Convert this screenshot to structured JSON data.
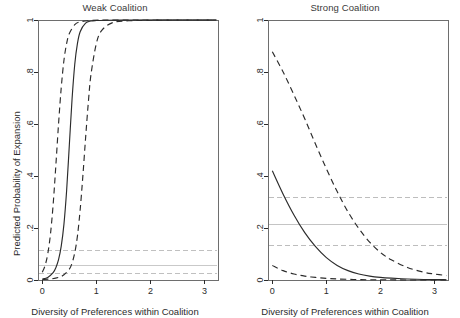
{
  "figure": {
    "width": 460,
    "height": 318,
    "background": "#ffffff",
    "ink": "#2b2b2b",
    "faint": "#b8b8b8"
  },
  "chart_data": [
    {
      "type": "line",
      "title": "Weak Coalition",
      "xlabel": "Diversity of Preferences within Coalition",
      "ylabel": "Predicted Probability of Expansion",
      "xlim": [
        -0.08,
        3.25
      ],
      "ylim": [
        0,
        1
      ],
      "xticks": [
        0,
        1,
        2,
        3
      ],
      "xticklabels": [
        "0",
        "1",
        "2",
        "3"
      ],
      "yticks": [
        0,
        0.2,
        0.4,
        0.6,
        0.8,
        1
      ],
      "yticklabels": [
        "0",
        ".2",
        ".4",
        ".6",
        ".8",
        "1"
      ],
      "grid": false,
      "legend": "none",
      "series": [
        {
          "name": "Predicted probability",
          "style": "solid",
          "color": "#2b2b2b",
          "x": [
            0.0,
            0.1,
            0.2,
            0.25,
            0.3,
            0.35,
            0.4,
            0.45,
            0.5,
            0.55,
            0.6,
            0.65,
            0.7,
            0.8,
            0.9,
            1.0,
            1.2,
            1.6,
            2.0,
            2.5,
            3.0,
            3.22
          ],
          "y": [
            0.004,
            0.01,
            0.028,
            0.047,
            0.078,
            0.13,
            0.215,
            0.345,
            0.52,
            0.695,
            0.83,
            0.91,
            0.955,
            0.988,
            0.996,
            0.998,
            0.999,
            1.0,
            1.0,
            1.0,
            1.0,
            1.0
          ]
        },
        {
          "name": "Upper 95% confidence bound",
          "style": "dashed",
          "color": "#2b2b2b",
          "x": [
            0.0,
            0.05,
            0.1,
            0.15,
            0.2,
            0.25,
            0.3,
            0.35,
            0.4,
            0.45,
            0.5,
            0.6,
            0.7,
            0.9,
            1.2,
            1.6,
            2.0,
            2.5,
            3.0,
            3.22
          ],
          "y": [
            0.03,
            0.055,
            0.1,
            0.175,
            0.29,
            0.44,
            0.6,
            0.74,
            0.845,
            0.91,
            0.948,
            0.982,
            0.993,
            0.998,
            1.0,
            1.0,
            1.0,
            1.0,
            1.0,
            1.0
          ]
        },
        {
          "name": "Lower 95% confidence bound",
          "style": "dashed",
          "color": "#2b2b2b",
          "x": [
            0.0,
            0.15,
            0.3,
            0.4,
            0.5,
            0.55,
            0.6,
            0.65,
            0.7,
            0.75,
            0.8,
            0.85,
            0.9,
            1.0,
            1.1,
            1.3,
            1.6,
            2.0,
            2.5,
            3.0,
            3.22
          ],
          "y": [
            0.002,
            0.004,
            0.01,
            0.02,
            0.042,
            0.065,
            0.105,
            0.17,
            0.27,
            0.4,
            0.545,
            0.68,
            0.79,
            0.91,
            0.96,
            0.99,
            0.997,
            0.999,
            1.0,
            1.0,
            1.0
          ]
        }
      ],
      "reference_lines": [
        {
          "name": "upper-reference",
          "style": "dashed",
          "y": 0.112,
          "color": "#c0c0c0"
        },
        {
          "name": "mean-reference",
          "style": "solid",
          "y": 0.055,
          "color": "#c9c9c9"
        },
        {
          "name": "lower-reference",
          "style": "dashed",
          "y": 0.025,
          "color": "#c0c0c0"
        }
      ]
    },
    {
      "type": "line",
      "title": "Strong Coalition",
      "xlabel": "Diversity of Preferences within Coalition",
      "ylabel": "Predicted Probability of Expansion",
      "xlim": [
        -0.08,
        3.25
      ],
      "ylim": [
        0,
        1
      ],
      "xticks": [
        0,
        1,
        2,
        3
      ],
      "xticklabels": [
        "0",
        "1",
        "2",
        "3"
      ],
      "yticks": [
        0,
        0.2,
        0.4,
        0.6,
        0.8,
        1
      ],
      "yticklabels": [
        "0",
        ".2",
        ".4",
        ".6",
        ".8",
        "1"
      ],
      "grid": false,
      "legend": "none",
      "series": [
        {
          "name": "Predicted probability",
          "style": "solid",
          "color": "#2b2b2b",
          "x": [
            0.0,
            0.2,
            0.4,
            0.6,
            0.8,
            1.0,
            1.2,
            1.4,
            1.6,
            1.8,
            2.0,
            2.2,
            2.5,
            2.8,
            3.0,
            3.22
          ],
          "y": [
            0.42,
            0.33,
            0.25,
            0.182,
            0.128,
            0.086,
            0.056,
            0.036,
            0.023,
            0.015,
            0.01,
            0.007,
            0.004,
            0.002,
            0.002,
            0.001
          ]
        },
        {
          "name": "Upper 95% confidence bound",
          "style": "dashed",
          "color": "#2b2b2b",
          "x": [
            0.0,
            0.2,
            0.4,
            0.6,
            0.8,
            1.0,
            1.2,
            1.4,
            1.6,
            1.8,
            2.0,
            2.2,
            2.5,
            2.8,
            3.0,
            3.22
          ],
          "y": [
            0.878,
            0.8,
            0.712,
            0.62,
            0.522,
            0.428,
            0.34,
            0.262,
            0.198,
            0.146,
            0.106,
            0.078,
            0.048,
            0.03,
            0.023,
            0.017
          ]
        },
        {
          "name": "Lower 95% confidence bound",
          "style": "dashed",
          "color": "#2b2b2b",
          "x": [
            0.0,
            0.2,
            0.4,
            0.6,
            0.8,
            1.0,
            1.2,
            1.5,
            1.8,
            2.1,
            2.5,
            3.0,
            3.22
          ],
          "y": [
            0.056,
            0.036,
            0.023,
            0.015,
            0.01,
            0.006,
            0.004,
            0.002,
            0.001,
            0.001,
            0.0,
            0.0,
            0.0
          ]
        }
      ],
      "reference_lines": [
        {
          "name": "upper-reference",
          "style": "dashed",
          "y": 0.318,
          "color": "#bdbdbd"
        },
        {
          "name": "mean-reference",
          "style": "solid",
          "y": 0.212,
          "color": "#c4c4c4"
        },
        {
          "name": "lower-reference",
          "style": "dashed",
          "y": 0.132,
          "color": "#bdbdbd"
        }
      ]
    }
  ]
}
